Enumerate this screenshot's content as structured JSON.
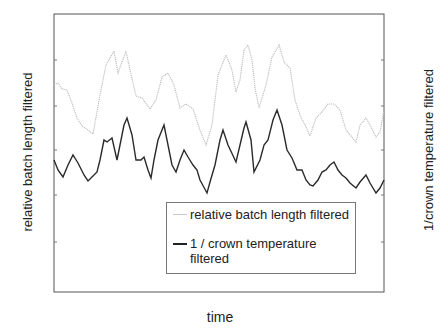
{
  "chart_data": {
    "type": "line",
    "title": "",
    "xlabel": "time",
    "ylabel_left": "relative batch length filtered",
    "ylabel_right": "1/crown temperature filtered",
    "grid": false,
    "legend_position": "inside lower right",
    "axis_ticks_labeled": false,
    "plot_box_px": {
      "x0": 54,
      "y0": 14,
      "x1": 384,
      "y1": 292
    },
    "y_ticks_px": [
      60,
      106,
      150,
      195,
      242
    ],
    "series": [
      {
        "name": "relative batch length filtered",
        "color": "#bdbdbd",
        "style": "dotted",
        "axis": "left",
        "points_px": [
          [
            54,
            85
          ],
          [
            58,
            83
          ],
          [
            62,
            89
          ],
          [
            67,
            90
          ],
          [
            72,
            103
          ],
          [
            77,
            118
          ],
          [
            82,
            126
          ],
          [
            88,
            130
          ],
          [
            93,
            134
          ],
          [
            100,
            95
          ],
          [
            106,
            65
          ],
          [
            114,
            51
          ],
          [
            118,
            73
          ],
          [
            122,
            62
          ],
          [
            126,
            51
          ],
          [
            130,
            70
          ],
          [
            136,
            96
          ],
          [
            142,
            98
          ],
          [
            150,
            109
          ],
          [
            156,
            100
          ],
          [
            162,
            77
          ],
          [
            168,
            73
          ],
          [
            174,
            85
          ],
          [
            180,
            108
          ],
          [
            186,
            104
          ],
          [
            193,
            109
          ],
          [
            200,
            130
          ],
          [
            206,
            145
          ],
          [
            212,
            125
          ],
          [
            218,
            75
          ],
          [
            226,
            55
          ],
          [
            232,
            70
          ],
          [
            236,
            92
          ],
          [
            240,
            80
          ],
          [
            244,
            50
          ],
          [
            248,
            45
          ],
          [
            252,
            60
          ],
          [
            255,
            88
          ],
          [
            259,
            108
          ],
          [
            266,
            85
          ],
          [
            272,
            57
          ],
          [
            279,
            45
          ],
          [
            284,
            62
          ],
          [
            290,
            68
          ],
          [
            295,
            100
          ],
          [
            300,
            115
          ],
          [
            305,
            125
          ],
          [
            310,
            136
          ],
          [
            316,
            118
          ],
          [
            322,
            112
          ],
          [
            328,
            104
          ],
          [
            334,
            104
          ],
          [
            340,
            110
          ],
          [
            346,
            130
          ],
          [
            356,
            142
          ],
          [
            360,
            125
          ],
          [
            366,
            118
          ],
          [
            370,
            125
          ],
          [
            376,
            137
          ],
          [
            380,
            132
          ],
          [
            384,
            110
          ]
        ]
      },
      {
        "name": "1 / crown temperature filtered",
        "color": "#2a2a2a",
        "style": "solid",
        "axis": "right",
        "points_px": [
          [
            54,
            160
          ],
          [
            58,
            170
          ],
          [
            63,
            177
          ],
          [
            68,
            165
          ],
          [
            73,
            155
          ],
          [
            78,
            163
          ],
          [
            84,
            175
          ],
          [
            88,
            181
          ],
          [
            92,
            177
          ],
          [
            97,
            172
          ],
          [
            100,
            160
          ],
          [
            104,
            140
          ],
          [
            107,
            142
          ],
          [
            112,
            138
          ],
          [
            117,
            160
          ],
          [
            120,
            145
          ],
          [
            124,
            125
          ],
          [
            127,
            118
          ],
          [
            132,
            135
          ],
          [
            136,
            160
          ],
          [
            141,
            160
          ],
          [
            144,
            157
          ],
          [
            148,
            170
          ],
          [
            151,
            178
          ],
          [
            154,
            160
          ],
          [
            158,
            140
          ],
          [
            164,
            125
          ],
          [
            167,
            140
          ],
          [
            172,
            165
          ],
          [
            176,
            172
          ],
          [
            180,
            160
          ],
          [
            184,
            150
          ],
          [
            188,
            157
          ],
          [
            193,
            165
          ],
          [
            197,
            170
          ],
          [
            200,
            180
          ],
          [
            207,
            193
          ],
          [
            210,
            182
          ],
          [
            215,
            165
          ],
          [
            220,
            140
          ],
          [
            223,
            130
          ],
          [
            228,
            145
          ],
          [
            236,
            162
          ],
          [
            240,
            145
          ],
          [
            244,
            128
          ],
          [
            246,
            122
          ],
          [
            251,
            140
          ],
          [
            254,
            172
          ],
          [
            260,
            160
          ],
          [
            264,
            145
          ],
          [
            268,
            140
          ],
          [
            273,
            120
          ],
          [
            277,
            110
          ],
          [
            282,
            125
          ],
          [
            287,
            150
          ],
          [
            292,
            158
          ],
          [
            297,
            170
          ],
          [
            302,
            170
          ],
          [
            306,
            180
          ],
          [
            310,
            185
          ],
          [
            313,
            186
          ],
          [
            318,
            180
          ],
          [
            322,
            172
          ],
          [
            326,
            170
          ],
          [
            330,
            165
          ],
          [
            334,
            162
          ],
          [
            338,
            170
          ],
          [
            342,
            175
          ],
          [
            346,
            178
          ],
          [
            350,
            183
          ],
          [
            356,
            188
          ],
          [
            360,
            182
          ],
          [
            366,
            175
          ],
          [
            370,
            183
          ],
          [
            376,
            193
          ],
          [
            380,
            188
          ],
          [
            384,
            180
          ]
        ]
      }
    ]
  },
  "labels": {
    "y_left": "relative batch length filtered",
    "y_right": "1/crown temperature filtered",
    "x": "time"
  },
  "legend": {
    "items": [
      {
        "label": "relative batch length filtered",
        "swatch": "gray"
      },
      {
        "label": "1 / crown temperature\nfiltered",
        "swatch": "black"
      }
    ]
  }
}
